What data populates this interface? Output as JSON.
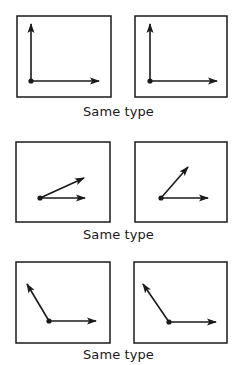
{
  "figure": {
    "stroke_color": "#1a1a1a",
    "background": "#ffffff",
    "rows": [
      {
        "caption": "Same type",
        "panels": [
          {
            "box": {
              "x": 17,
              "y": 16,
              "w": 94,
              "h": 81
            },
            "origin": [
              31,
              81
            ],
            "vectors": [
              {
                "to": [
                  31,
                  24
                ]
              },
              {
                "to": [
                  99,
                  81
                ]
              }
            ]
          },
          {
            "box": {
              "x": 135,
              "y": 16,
              "w": 92,
              "h": 81
            },
            "origin": [
              150,
              81
            ],
            "vectors": [
              {
                "to": [
                  150,
                  24
                ]
              },
              {
                "to": [
                  217,
                  81
                ]
              }
            ]
          }
        ]
      },
      {
        "caption": "Same type",
        "panels": [
          {
            "box": {
              "x": 16,
              "y": 142,
              "w": 94,
              "h": 80
            },
            "origin": [
              40,
              198
            ],
            "vectors": [
              {
                "to": [
                  84,
                  178
                ]
              },
              {
                "to": [
                  85,
                  198
                ]
              }
            ]
          },
          {
            "box": {
              "x": 135,
              "y": 142,
              "w": 92,
              "h": 80
            },
            "origin": [
              161,
              198
            ],
            "vectors": [
              {
                "to": [
                  188,
                  167
                ]
              },
              {
                "to": [
                  208,
                  198
                ]
              }
            ]
          }
        ]
      },
      {
        "caption": "Same type",
        "panels": [
          {
            "box": {
              "x": 16,
              "y": 262,
              "w": 94,
              "h": 81
            },
            "origin": [
              49,
              321
            ],
            "vectors": [
              {
                "to": [
                  27,
                  284
                ]
              },
              {
                "to": [
                  96,
                  321
                ]
              }
            ]
          },
          {
            "box": {
              "x": 134,
              "y": 262,
              "w": 93,
              "h": 81
            },
            "origin": [
              169,
              322
            ],
            "vectors": [
              {
                "to": [
                  143,
                  284
                ]
              },
              {
                "to": [
                  216,
                  322
                ]
              }
            ]
          }
        ]
      }
    ]
  }
}
